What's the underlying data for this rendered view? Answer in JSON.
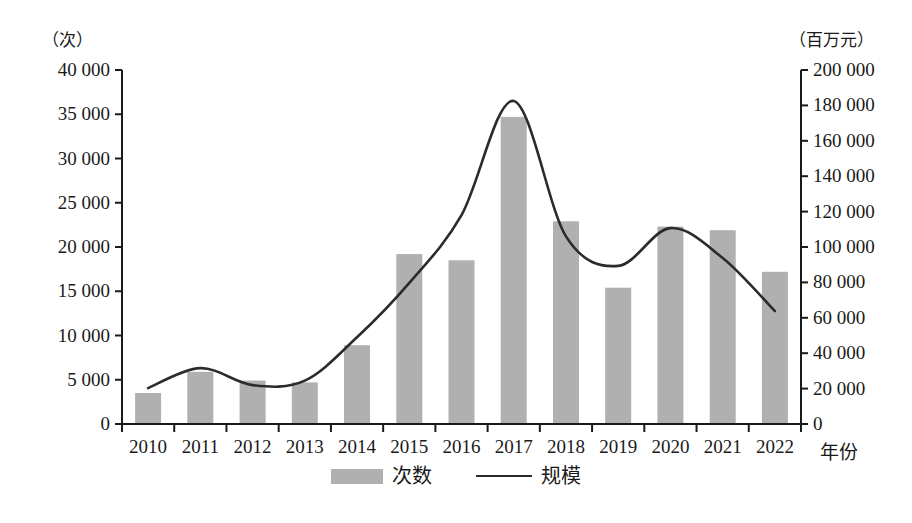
{
  "chart_data": {
    "type": "bar",
    "title": "",
    "subtitle": "",
    "xlabel": "年份",
    "categories": [
      "2010",
      "2011",
      "2012",
      "2013",
      "2014",
      "2015",
      "2016",
      "2017",
      "2018",
      "2019",
      "2020",
      "2021",
      "2022"
    ],
    "left_axis": {
      "unit_label": "（次）",
      "ticks": [
        "0",
        "5 000",
        "10 000",
        "15 000",
        "20 000",
        "25 000",
        "30 000",
        "35 000",
        "40 000"
      ],
      "tick_values": [
        0,
        5000,
        10000,
        15000,
        20000,
        25000,
        30000,
        35000,
        40000
      ],
      "ylim": [
        0,
        40000
      ]
    },
    "right_axis": {
      "unit_label": "（百万元）",
      "ticks": [
        "0",
        "20 000",
        "40 000",
        "60 000",
        "80 000",
        "100 000",
        "120 000",
        "140 000",
        "160 000",
        "180 000",
        "200 000"
      ],
      "tick_values": [
        0,
        20000,
        40000,
        60000,
        80000,
        100000,
        120000,
        140000,
        160000,
        180000,
        200000
      ],
      "ylim": [
        0,
        200000
      ]
    },
    "grid": false,
    "legend_position": "bottom",
    "series": [
      {
        "name": "次数",
        "kind": "bar",
        "axis": "left",
        "color": "#b0b0b0",
        "values": [
          3500,
          5900,
          4900,
          4700,
          8900,
          19200,
          18500,
          34700,
          22900,
          15400,
          22300,
          21900,
          17200
        ]
      },
      {
        "name": "规模",
        "kind": "line",
        "axis": "right",
        "color": "#2b2b2b",
        "values": [
          20300,
          31600,
          22000,
          24500,
          49000,
          79700,
          118000,
          182500,
          106000,
          89300,
          110700,
          93800,
          63800
        ]
      }
    ]
  },
  "legend": {
    "items": [
      {
        "label": "次数",
        "marker": "bar-swatch"
      },
      {
        "label": "规模",
        "marker": "line-swatch"
      }
    ]
  }
}
